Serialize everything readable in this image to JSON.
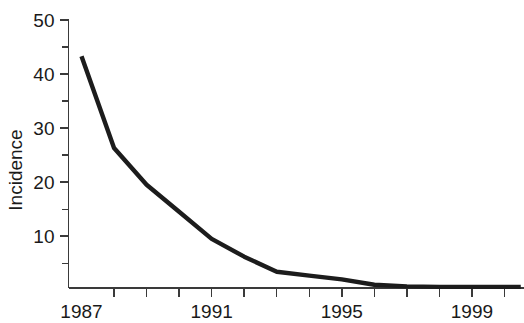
{
  "chart_data": {
    "type": "line",
    "title": "",
    "subtitle": "",
    "xlabel": "",
    "ylabel": "Incidence",
    "xlim": [
      1986.6,
      2000.6
    ],
    "ylim": [
      0.4,
      50
    ],
    "grid": false,
    "legend": null,
    "x_tick_labels": [
      "1987",
      "1991",
      "1995",
      "1999"
    ],
    "x_labeled_ticks": [
      1987,
      1991,
      1995,
      1999
    ],
    "x_all_ticks": [
      1987,
      1988,
      1989,
      1990,
      1991,
      1992,
      1993,
      1994,
      1995,
      1996,
      1997,
      1998,
      1999,
      2000
    ],
    "y_tick_labels": [
      "10",
      "20",
      "30",
      "40",
      "50"
    ],
    "y_major_ticks": [
      10,
      20,
      30,
      40,
      50
    ],
    "y_minor_ticks": [
      5,
      15,
      25,
      35,
      45
    ],
    "series": [
      {
        "name": "Incidence",
        "color": "#1c1c1c",
        "x": [
          1987,
          1988,
          1989,
          1990,
          1991,
          1992,
          1993,
          1994,
          1995,
          1996,
          1997,
          1998,
          1999,
          2000,
          2000.5
        ],
        "values": [
          43.3,
          26.3,
          19.5,
          14.5,
          9.5,
          6.2,
          3.4,
          2.7,
          2.0,
          1.0,
          0.7,
          0.6,
          0.6,
          0.6,
          0.6
        ]
      }
    ]
  },
  "axis": {
    "y_title": "Incidence"
  }
}
